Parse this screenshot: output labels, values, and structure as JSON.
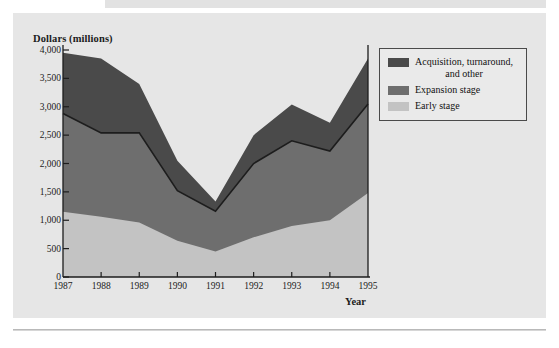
{
  "figure": {
    "background_color": "#e6e6e6",
    "page_color": "#ffffff"
  },
  "chart_data": {
    "type": "area",
    "stacked": true,
    "title": "",
    "xlabel": "Year",
    "ylabel": "Dollars (millions)",
    "categories": [
      "1987",
      "1988",
      "1989",
      "1990",
      "1991",
      "1992",
      "1993",
      "1994",
      "1995"
    ],
    "x": [
      1987,
      1988,
      1989,
      1990,
      1991,
      1992,
      1993,
      1994,
      1995
    ],
    "xlim": [
      1987,
      1995
    ],
    "ylim": [
      0,
      4000
    ],
    "ytick_labels": [
      "0",
      "500",
      "1,000",
      "1,500",
      "2,000",
      "2,500",
      "3,000",
      "3,500",
      "4,000"
    ],
    "ytick_values": [
      0,
      500,
      1000,
      1500,
      2000,
      2500,
      3000,
      3500,
      4000
    ],
    "grid": false,
    "legend_position": "upper right",
    "series": [
      {
        "name": "Early stage",
        "color": "#c3c3c3",
        "values": [
          1150,
          1060,
          960,
          640,
          450,
          700,
          900,
          1000,
          1480
        ]
      },
      {
        "name": "Expansion stage",
        "color": "#6e6e6e",
        "values": [
          1730,
          1480,
          1580,
          880,
          710,
          1300,
          1500,
          1220,
          1570
        ]
      },
      {
        "name": "Acquisition, turnaround, and other",
        "color": "#4a4a4a",
        "values": [
          1070,
          1310,
          860,
          530,
          170,
          500,
          640,
          500,
          800
        ]
      }
    ],
    "cumulative_tops": {
      "early_stage": [
        1150,
        1060,
        960,
        640,
        450,
        700,
        900,
        1000,
        1480
      ],
      "expansion_stage": [
        2880,
        2540,
        2540,
        1520,
        1160,
        2000,
        2400,
        2220,
        3050
      ],
      "total": [
        3950,
        3850,
        3400,
        2050,
        1330,
        2500,
        3040,
        2720,
        3850
      ]
    }
  },
  "legend": {
    "items": [
      {
        "label_line1": "Acquisition, turnaround,",
        "label_line2": "and other",
        "color": "#4a4a4a"
      },
      {
        "label_line1": "Expansion stage",
        "label_line2": "",
        "color": "#6e6e6e"
      },
      {
        "label_line1": "Early stage",
        "label_line2": "",
        "color": "#c3c3c3"
      }
    ]
  }
}
